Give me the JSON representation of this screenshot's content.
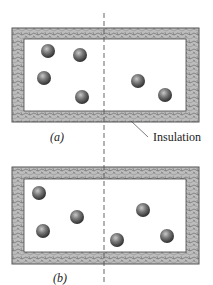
{
  "figure": {
    "panels": [
      {
        "label": "(a)",
        "outer": {
          "x": 12,
          "y": 28,
          "w": 187,
          "h": 94
        },
        "inner": {
          "x": 24,
          "y": 39,
          "w": 162,
          "h": 72
        },
        "label_pos": {
          "x": 57,
          "y": 141
        },
        "molecules": [
          {
            "x": 48,
            "y": 51
          },
          {
            "x": 80,
            "y": 55
          },
          {
            "x": 44,
            "y": 78
          },
          {
            "x": 82,
            "y": 97
          },
          {
            "x": 138,
            "y": 81
          },
          {
            "x": 165,
            "y": 95
          }
        ]
      },
      {
        "label": "(b)",
        "outer": {
          "x": 12,
          "y": 167,
          "w": 187,
          "h": 97
        },
        "inner": {
          "x": 24,
          "y": 179,
          "w": 162,
          "h": 73
        },
        "label_pos": {
          "x": 60,
          "y": 282
        },
        "molecules": [
          {
            "x": 39,
            "y": 193
          },
          {
            "x": 77,
            "y": 217
          },
          {
            "x": 43,
            "y": 231
          },
          {
            "x": 143,
            "y": 210
          },
          {
            "x": 117,
            "y": 240
          },
          {
            "x": 167,
            "y": 236
          }
        ]
      }
    ],
    "annotation": {
      "text": "Insulation",
      "text_pos": {
        "x": 153,
        "y": 141
      },
      "leader": {
        "x1": 131,
        "y1": 121,
        "x2": 148,
        "y2": 137
      }
    },
    "divider": {
      "x": 104,
      "y1": 13,
      "y2": 285
    },
    "colors": {
      "insulation_fill": "#b9b9b9",
      "insulation_stroke": "#555555",
      "molecule_dark": "#3a3a3a",
      "molecule_light": "#bdbdbd",
      "divider": "#555555"
    },
    "molecule_radius": 7
  }
}
